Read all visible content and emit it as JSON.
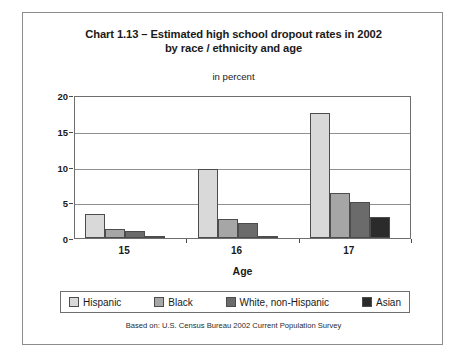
{
  "figure": {
    "title_lines": [
      "Chart 1.13 – Estimated high school dropout rates in 2002",
      "by race / ethnicity and age"
    ],
    "subtitle": "in percent",
    "source_note": "Based on: U.S. Census Bureau 2002 Current Population Survey"
  },
  "chart_data": {
    "type": "bar",
    "title": "Chart 1.13 – Estimated high school dropout rates in 2002 by race / ethnicity and age",
    "subtitle": "in percent",
    "xlabel": "Age",
    "ylabel": "",
    "categories": [
      "15",
      "16",
      "17"
    ],
    "ylim": [
      0,
      20
    ],
    "yticks": [
      0,
      5,
      10,
      15,
      20
    ],
    "ytick_labels": [
      "0",
      "5",
      "10",
      "15",
      "20"
    ],
    "grid": true,
    "legend_position": "bottom",
    "series": [
      {
        "name": "Hispanic",
        "color": "#d9d9d9",
        "values": [
          3.3,
          9.7,
          17.5
        ]
      },
      {
        "name": "Black",
        "color": "#a6a6a6",
        "values": [
          1.3,
          2.7,
          6.3
        ]
      },
      {
        "name": "White, non-Hispanic",
        "color": "#6b6b6b",
        "values": [
          1.0,
          2.1,
          5.0
        ]
      },
      {
        "name": "Asian",
        "color": "#2b2b2b",
        "values": [
          0.2,
          0.3,
          3.0
        ]
      }
    ],
    "source": "Based on: U.S. Census Bureau 2002 Current Population Survey"
  }
}
